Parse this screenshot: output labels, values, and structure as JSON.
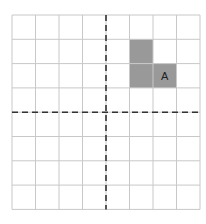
{
  "grid": {
    "rows": 8,
    "cols": 8,
    "origin_x": 12,
    "origin_y": 15,
    "cell_w": 23.5,
    "cell_h": 24.3,
    "line_color": "#c8c8c8",
    "axis_color": "#333333"
  },
  "axes": {
    "vertical_col_boundary": 4,
    "horizontal_row_boundary": 4
  },
  "shape_A": {
    "label": "A",
    "fill": "#999999",
    "cells": [
      [
        5,
        1
      ],
      [
        5,
        2
      ],
      [
        6,
        2
      ]
    ],
    "label_cell": [
      6,
      2
    ]
  }
}
